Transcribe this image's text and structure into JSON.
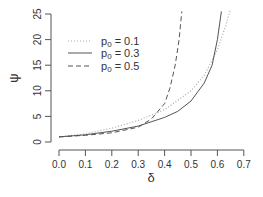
{
  "chart_data": {
    "type": "line",
    "title": "",
    "xlabel": "δ",
    "ylabel": "ψ",
    "xlim": [
      0.0,
      0.7
    ],
    "ylim": [
      0,
      25
    ],
    "x_ticks": [
      "0.0",
      "0.1",
      "0.2",
      "0.3",
      "0.4",
      "0.5",
      "0.6",
      "0.7"
    ],
    "y_ticks": [
      "0",
      "5",
      "10",
      "15",
      "20",
      "25"
    ],
    "grid": false,
    "legend_position": "top-left",
    "series": [
      {
        "name": "p0 = 0.1",
        "line_style": "dotted",
        "color": "#aaaaaa",
        "x": [
          0.0,
          0.1,
          0.2,
          0.3,
          0.4,
          0.5,
          0.55,
          0.6,
          0.63,
          0.65
        ],
        "y": [
          1.0,
          1.6,
          2.7,
          4.2,
          6.3,
          10.0,
          13.0,
          18.0,
          22.5,
          26.0
        ]
      },
      {
        "name": "p0 = 0.3",
        "line_style": "solid",
        "color": "#555555",
        "x": [
          0.0,
          0.1,
          0.2,
          0.3,
          0.4,
          0.45,
          0.5,
          0.55,
          0.58,
          0.6,
          0.615
        ],
        "y": [
          1.0,
          1.4,
          2.1,
          3.1,
          4.8,
          6.0,
          8.0,
          11.5,
          15.0,
          20.0,
          25.5
        ]
      },
      {
        "name": "p0 = 0.5",
        "line_style": "dashed",
        "color": "#555555",
        "x": [
          0.0,
          0.1,
          0.2,
          0.3,
          0.35,
          0.4,
          0.42,
          0.44,
          0.455,
          0.465
        ],
        "y": [
          1.0,
          1.3,
          1.8,
          2.9,
          4.5,
          7.5,
          10.5,
          15.0,
          20.0,
          25.5
        ]
      }
    ]
  },
  "legend": {
    "items": [
      {
        "prefix": "p",
        "sub": "0",
        "suffix": " = 0.1"
      },
      {
        "prefix": "p",
        "sub": "0",
        "suffix": " = 0.3"
      },
      {
        "prefix": "p",
        "sub": "0",
        "suffix": " = 0.5"
      }
    ]
  },
  "axes": {
    "xlabel": "δ",
    "ylabel": "ψ"
  }
}
